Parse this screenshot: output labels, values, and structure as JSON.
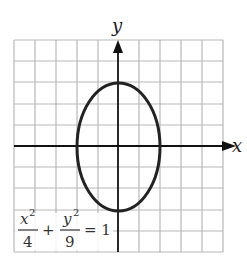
{
  "figure": {
    "x_axis_label": "x",
    "y_axis_label": "y",
    "equation": {
      "term1_num": "x",
      "term1_exp": "2",
      "term1_den": "4",
      "plus": "+",
      "term2_num": "y",
      "term2_exp": "2",
      "term2_den": "9",
      "equals": "= 1"
    },
    "grid": {
      "columns": 10,
      "rows": 10,
      "x_range": [
        -5,
        5
      ],
      "y_range": [
        -5,
        5
      ]
    },
    "ellipse": {
      "a": 2,
      "b": 3,
      "center": [
        0,
        0
      ]
    },
    "colors": {
      "grid": "#b8b8b8",
      "axis": "#111111",
      "curve": "#222222"
    }
  }
}
